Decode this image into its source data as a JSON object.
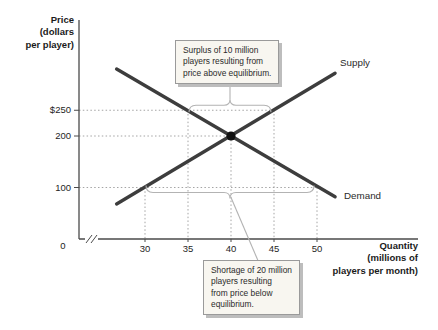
{
  "chart_data": {
    "type": "line",
    "title": "",
    "ylabel": "Price\n(dollars\nper player)",
    "xlabel": "Quantity\n(millions of\nplayers per month)",
    "origin_label": "0",
    "x_ticks": [
      30,
      35,
      40,
      45,
      50
    ],
    "y_ticks": [
      {
        "label": "$250",
        "value": 250
      },
      {
        "label": "200",
        "value": 200
      },
      {
        "label": "100",
        "value": 100
      }
    ],
    "xlim": [
      26.5,
      52.5
    ],
    "ylim": [
      0,
      430
    ],
    "grid": "off",
    "series": [
      {
        "name": "Supply",
        "points": [
          {
            "x": 26.7,
            "y": 68
          },
          {
            "x": 52.1,
            "y": 322
          }
        ]
      },
      {
        "name": "Demand",
        "points": [
          {
            "x": 26.7,
            "y": 330
          },
          {
            "x": 52.1,
            "y": 82
          }
        ]
      }
    ],
    "equilibrium": {
      "x": 40,
      "y": 200
    },
    "surplus_at_price_250": {
      "quantity_demanded": 35,
      "quantity_supplied": 45,
      "surplus_millions": 10
    },
    "shortage_at_price_100": {
      "quantity_demanded": 50,
      "quantity_supplied": 30,
      "shortage_millions": 20
    },
    "guides": {
      "horizontal": [
        {
          "price": 250,
          "to_q": 45
        },
        {
          "price": 200,
          "to_q": 40
        },
        {
          "price": 100,
          "to_q": 50
        }
      ],
      "vertical": [
        {
          "q": 35,
          "from_price": 250
        },
        {
          "q": 40,
          "from_price": 200
        },
        {
          "q": 45,
          "from_price": 250
        },
        {
          "q": 30,
          "from_price": 100
        },
        {
          "q": 50,
          "from_price": 100
        }
      ]
    },
    "brackets": [
      {
        "id": "surplus",
        "from_q": 35,
        "to_q": 45,
        "at_price": 250,
        "side": "above"
      },
      {
        "id": "shortage",
        "from_q": 30,
        "to_q": 50,
        "at_price": 100,
        "side": "below"
      }
    ],
    "annotations": [
      {
        "id": "surplus-note",
        "text": "Surplus of 10 million\nplayers resulting from\nprice above equilibrium."
      },
      {
        "id": "shortage-note",
        "text": "Shortage of 20 million\nplayers resulting\nfrom price below\nequilibrium."
      }
    ]
  },
  "colors": {
    "curve": "#3d3d3d",
    "axis": "#4a4a4a",
    "guide": "#9a9a9a",
    "bracket": "#b3b3b3",
    "equilibrium_dot": "#101010",
    "note_bg": "#f8f6f0",
    "note_border": "#9a9a9a",
    "note_shadow": "#bdbdbd",
    "text": "#1e1e1e"
  }
}
